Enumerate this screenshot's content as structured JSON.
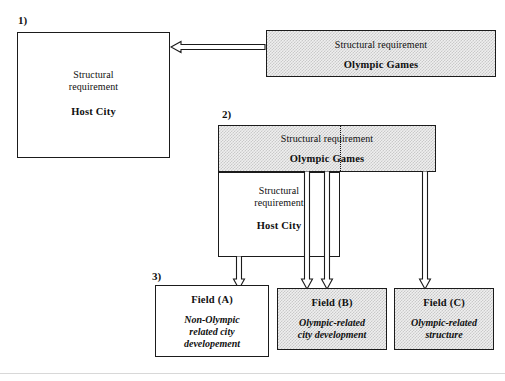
{
  "diagram": {
    "steps": [
      {
        "id": "step1",
        "label": "1)"
      },
      {
        "id": "step2",
        "label": "2)"
      },
      {
        "id": "step3",
        "label": "3)"
      }
    ],
    "boxes": {
      "host_city_1": {
        "line1": "Structural",
        "line1b": "requirement",
        "line2": "Host City",
        "fill": "white"
      },
      "olympic_games_1": {
        "line1": "Structural requirement",
        "line2": "Olympic Games",
        "fill": "stippled"
      },
      "olympic_games_2": {
        "line1": "Structural requirement",
        "line2": "Olympic Games",
        "fill": "stippled"
      },
      "host_city_2": {
        "line1": "Structural",
        "line1b": "requirement",
        "line2": "Host City",
        "fill": "white"
      },
      "field_a": {
        "title": "Field (A)",
        "body1": "Non-Olympic",
        "body2": "related city",
        "body3": "developement",
        "fill": "white"
      },
      "field_b": {
        "title": "Field (B)",
        "body1": "Olympic-related",
        "body2": "city development",
        "body3": "",
        "fill": "stippled"
      },
      "field_c": {
        "title": "Field (C)",
        "body1": "Olympic-related",
        "body2": "structure",
        "body3": "",
        "fill": "stippled"
      }
    },
    "arrows": [
      {
        "id": "arrow-olympic-to-hostcity",
        "direction": "left"
      },
      {
        "id": "arrow-hostcity2-to-field-a",
        "direction": "down"
      },
      {
        "id": "arrow-olympic2-to-field-a",
        "direction": "down"
      },
      {
        "id": "arrow-olympic2-to-field-b",
        "direction": "down"
      },
      {
        "id": "arrow-olympic2-to-field-c",
        "direction": "down"
      }
    ],
    "colors": {
      "stroke": "#1b1b1b",
      "stipple": "#c9c9c9",
      "background": "#ffffff"
    }
  }
}
